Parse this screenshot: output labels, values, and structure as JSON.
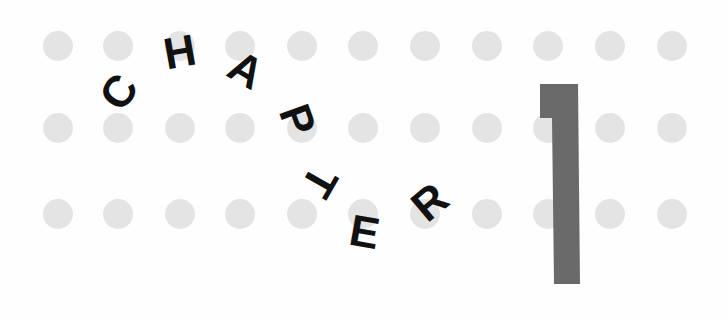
{
  "heading": {
    "word": "CHAPTER",
    "letters": [
      "C",
      "H",
      "A",
      "P",
      "T",
      "E",
      "R"
    ],
    "number": "1"
  },
  "colors": {
    "dots": "#e4e4e4",
    "letters": "#111111",
    "numeral": "#6a6a6a"
  }
}
